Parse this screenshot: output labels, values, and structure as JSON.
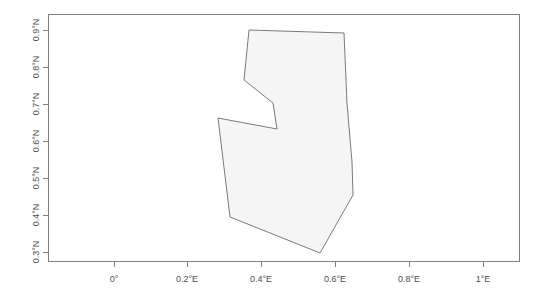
{
  "figure": {
    "type": "map",
    "background_color": "#ffffff",
    "plot_box": {
      "left": 48,
      "top": 14,
      "right": 520,
      "bottom": 262,
      "border_color": "#808080"
    }
  },
  "axes": {
    "x": {
      "label": "",
      "unit": "degrees east",
      "ticks": [
        {
          "value": 0.0,
          "label": "0°",
          "px": 114
        },
        {
          "value": 0.2,
          "label": "0.2°E",
          "px": 187
        },
        {
          "value": 0.4,
          "label": "0.4°E",
          "px": 261
        },
        {
          "value": 0.6,
          "label": "0.6°E",
          "px": 335
        },
        {
          "value": 0.8,
          "label": "0.8°E",
          "px": 409
        },
        {
          "value": 1.0,
          "label": "1°E",
          "px": 483
        }
      ]
    },
    "y": {
      "label": "",
      "unit": "degrees north",
      "ticks": [
        {
          "value": 0.9,
          "label": "0.9°N",
          "px": 30
        },
        {
          "value": 0.8,
          "label": "0.8°N",
          "px": 67
        },
        {
          "value": 0.7,
          "label": "0.7°N",
          "px": 104
        },
        {
          "value": 0.6,
          "label": "0.6°N",
          "px": 141
        },
        {
          "value": 0.5,
          "label": "0.5°N",
          "px": 178
        },
        {
          "value": 0.4,
          "label": "0.4°N",
          "px": 215
        },
        {
          "value": 0.3,
          "label": "0.3°N",
          "px": 252
        }
      ]
    }
  },
  "chart_data": {
    "type": "map",
    "title": "",
    "xlabel": "",
    "ylabel": "",
    "xlim": [
      -0.31,
      1.0
    ],
    "ylim": [
      0.27,
      0.945
    ],
    "grid": false,
    "legend": null,
    "shapes": [
      {
        "name": "region-polygon",
        "fill": "#f5f5f5",
        "stroke": "#7a7a7a",
        "points_px": "249,30 344,33 347,103 352,162 353,195 320,253 230,217 218,118 277,129 273,103 244,80",
        "points_deg": [
          [
            0.366,
            0.902
          ],
          [
            0.623,
            0.894
          ],
          [
            0.631,
            0.705
          ],
          [
            0.644,
            0.545
          ],
          [
            0.647,
            0.456
          ],
          [
            0.558,
            0.3
          ],
          [
            0.314,
            0.397
          ],
          [
            0.282,
            0.664
          ],
          [
            0.441,
            0.634
          ],
          [
            0.43,
            0.705
          ],
          [
            0.351,
            0.767
          ]
        ]
      }
    ]
  }
}
